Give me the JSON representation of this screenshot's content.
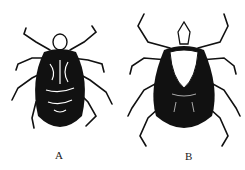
{
  "figures": [
    {
      "id": "A",
      "label": "A",
      "subject": "tick-illustration-patterned"
    },
    {
      "id": "B",
      "label": "B",
      "subject": "tick-illustration-dark"
    }
  ],
  "colors": {
    "ink": "#111111",
    "paper": "#ffffff"
  }
}
